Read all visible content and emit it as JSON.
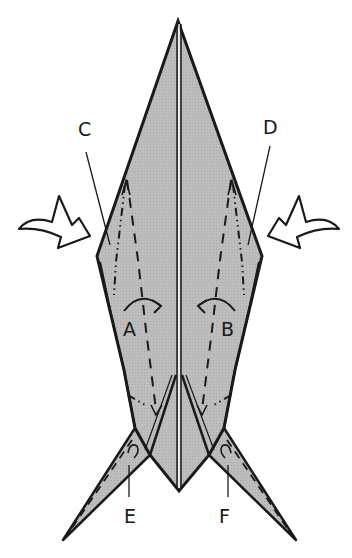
{
  "diagram": {
    "type": "origami-fold-diagram",
    "fill_color": "#b9b9b9",
    "line_color": "#1a1a1a",
    "labels": [
      {
        "id": "A",
        "text": "A",
        "x": 123,
        "y": 320
      },
      {
        "id": "B",
        "text": "B",
        "x": 221,
        "y": 320
      },
      {
        "id": "C",
        "text": "C",
        "x": 78,
        "y": 120
      },
      {
        "id": "D",
        "text": "D",
        "x": 263,
        "y": 118
      },
      {
        "id": "E",
        "text": "E",
        "x": 124,
        "y": 507
      },
      {
        "id": "F",
        "text": "F",
        "x": 219,
        "y": 507
      }
    ],
    "symbols": {
      "left_push_arrow": "hollow-push-arrow-right",
      "right_push_arrow": "hollow-push-arrow-left",
      "fold_arrow_a": "curved-arrow-right",
      "fold_arrow_b": "curved-arrow-left"
    }
  }
}
